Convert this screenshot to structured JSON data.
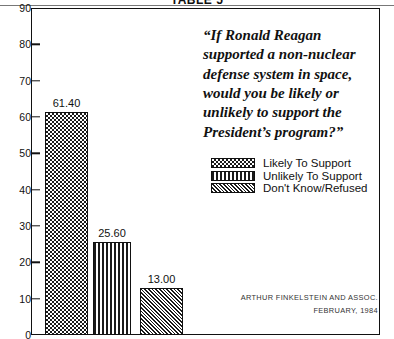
{
  "title": "TABLE 5",
  "quote": [
    "“If Ronald Reagan",
    "supported a non-nuclear",
    "defense system in space,",
    "would you be likely or",
    "unlikely to support the",
    "President’s program?”"
  ],
  "legend": [
    {
      "label": "Likely To Support",
      "pattern": "checkerboard"
    },
    {
      "label": "Unlikely To Support",
      "pattern": "vertical-stripes"
    },
    {
      "label": "Don't Know/Refused",
      "pattern": "diagonal-hatch"
    }
  ],
  "attribution": {
    "firm": "ARTHUR FINKELSTEIN AND ASSOC.",
    "date": "FEBRUARY, 1984"
  },
  "chart_data": {
    "type": "bar",
    "title": "TABLE 5",
    "xlabel": "",
    "ylabel": "",
    "ylim": [
      0,
      90
    ],
    "yticks": [
      0,
      10,
      20,
      30,
      40,
      50,
      60,
      70,
      80,
      90
    ],
    "grid": false,
    "legend_position": "upper-right",
    "categories": [
      "Likely To Support",
      "Unlikely To Support",
      "Don't Know/Refused"
    ],
    "values": [
      61.4,
      25.6,
      13.0
    ],
    "value_labels": [
      "61.40",
      "25.60",
      "13.00"
    ],
    "patterns": [
      "checkerboard",
      "vertical-stripes",
      "diagonal-hatch"
    ],
    "annotations": [
      "“If Ronald Reagan supported a non-nuclear defense system in space, would you be likely or unlikely to support the President’s program?”",
      "ARTHUR FINKELSTEIN AND ASSOC.",
      "FEBRUARY, 1984"
    ]
  }
}
